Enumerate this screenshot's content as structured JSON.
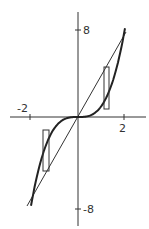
{
  "chart_data": {
    "type": "line",
    "title": "",
    "xlabel": "",
    "ylabel": "",
    "xlim": [
      -2.4,
      2.7
    ],
    "ylim": [
      -9.7,
      9.5
    ],
    "grid": false,
    "legend": null,
    "x_ticks": [
      {
        "value": -2,
        "label": "-2"
      },
      {
        "value": 2,
        "label": "2"
      }
    ],
    "y_ticks": [
      {
        "value": 8,
        "label": "8"
      },
      {
        "value": -8,
        "label": "-8"
      }
    ],
    "series": [
      {
        "name": "cubic curve y = x^3",
        "style": "thick",
        "x": [
          -2,
          -1.75,
          -1.5,
          -1.25,
          -1,
          -0.75,
          -0.5,
          -0.25,
          0,
          0.25,
          0.5,
          0.75,
          1,
          1.25,
          1.5,
          1.75,
          2
        ],
        "y": [
          -8,
          -5.36,
          -3.375,
          -1.95,
          -1,
          -0.42,
          -0.125,
          -0.016,
          0,
          0.016,
          0.125,
          0.42,
          1,
          1.95,
          3.375,
          5.36,
          8
        ]
      },
      {
        "name": "straight line y = 4x",
        "style": "thin",
        "x": [
          -2,
          2
        ],
        "y": [
          -8,
          8
        ]
      }
    ],
    "annotations": [
      {
        "type": "rectangle",
        "description": "representative strip between line and curve (right)",
        "x_range": [
          1.1,
          1.3
        ],
        "y_range": [
          1.6,
          5.5
        ]
      },
      {
        "type": "rectangle",
        "description": "representative strip between curve and line (left)",
        "x_range": [
          -1.5,
          -1.25
        ],
        "y_range": [
          -5.2,
          -1.5
        ]
      }
    ]
  },
  "labels": {
    "x_neg": "-2",
    "x_pos": "2",
    "y_pos": "8",
    "y_neg": "-8"
  }
}
